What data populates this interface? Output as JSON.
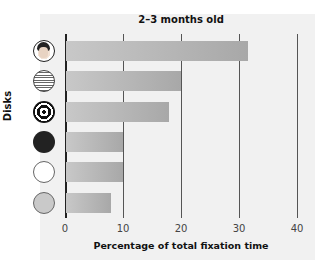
{
  "chart_data": {
    "type": "bar",
    "orientation": "horizontal",
    "title": "2–3 months old",
    "xlabel": "Percentage of total fixation time",
    "ylabel": "Disks",
    "categories": [
      "Face",
      "Printed text",
      "Bull's-eye",
      "Black disk",
      "White disk",
      "Gray disk"
    ],
    "values": [
      31.5,
      20,
      18,
      10,
      10,
      8
    ],
    "xlim": [
      0,
      40
    ],
    "xticks": [
      "0",
      "10",
      "20",
      "30",
      "40"
    ],
    "grid": true,
    "bar_color": "#b8b8b8"
  }
}
